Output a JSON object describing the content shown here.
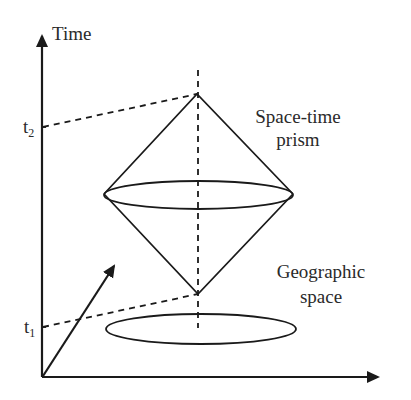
{
  "diagram": {
    "type": "space-time prism",
    "axes": {
      "y_label": "Time",
      "x_label": ""
    },
    "time_marks": [
      {
        "label": "t",
        "sub": "2",
        "y": 127
      },
      {
        "label": "t",
        "sub": "1",
        "y": 326
      }
    ],
    "labels": {
      "prism_line1": "Space-time",
      "prism_line2": "prism",
      "space_line1": "Geographic",
      "space_line2": "space"
    },
    "colors": {
      "stroke": "#1a1a1a",
      "text": "#2a2a2a",
      "background": "#ffffff"
    }
  }
}
